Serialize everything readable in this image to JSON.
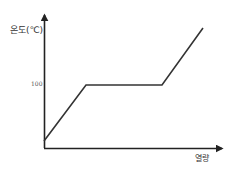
{
  "chart_data": {
    "type": "line",
    "title": "",
    "xlabel": "열량",
    "ylabel": "온도(℃)",
    "y_ticks": [
      "100"
    ],
    "x_ticks": [],
    "grid": false,
    "legend": null,
    "series": [
      {
        "name": "heating-curve",
        "points": [
          {
            "x": 0,
            "y": 10
          },
          {
            "x": 1,
            "y": 100
          },
          {
            "x": 2.8,
            "y": 100
          },
          {
            "x": 3.7,
            "y": 190
          }
        ]
      }
    ],
    "pixel_points": [
      [
        44,
        141
      ],
      [
        86,
        85
      ],
      [
        162,
        85
      ],
      [
        203,
        28
      ]
    ],
    "colors": {
      "line": "#333333",
      "axis": "#222222",
      "background": "#ffffff"
    }
  },
  "labels": {
    "ylabel": "온도(℃)",
    "xlabel": "열량",
    "ytick_100": "100"
  }
}
